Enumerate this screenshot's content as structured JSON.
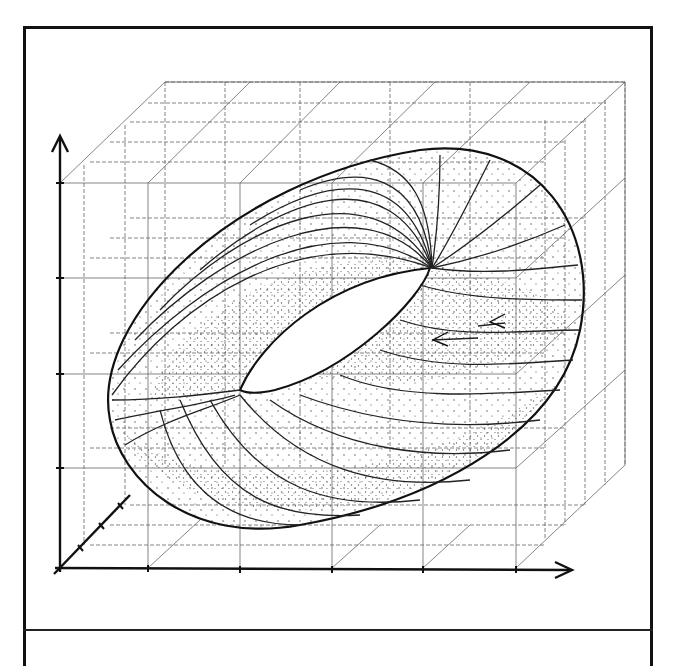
{
  "figure": {
    "style": {
      "ink": "#111111",
      "grid": "#555555",
      "stipple": "#333333",
      "background": "#ffffff"
    },
    "axes": {
      "x": {
        "ticks": 5,
        "arrow": true
      },
      "y": {
        "ticks": 4,
        "arrow": true
      },
      "z": {
        "ticks": 3,
        "arrow": false
      }
    },
    "elements": [
      "3d-grid-box",
      "torus-outline",
      "torus-hole",
      "flow-lines",
      "flow-direction-arrows",
      "stippled-shading"
    ],
    "flow_arrows": 2
  },
  "caption": {
    "text": ""
  }
}
